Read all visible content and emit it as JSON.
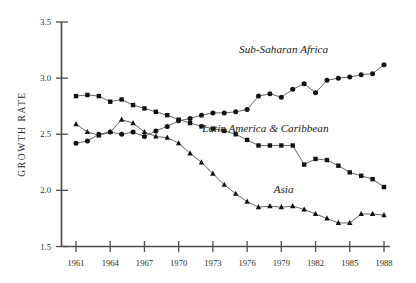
{
  "chart_data": {
    "type": "line",
    "title": "",
    "xlabel": "",
    "ylabel": "GROWTH RATE",
    "xlim": [
      1960,
      1989
    ],
    "ylim": [
      1.5,
      3.5
    ],
    "grid": false,
    "legend_position": "inline-annotations",
    "ytick_labels": [
      "1.5",
      "2.0",
      "2.5",
      "3.0",
      "3.5"
    ],
    "ytick_values": [
      1.5,
      2.0,
      2.5,
      3.0,
      3.5
    ],
    "xtick_labels": [
      "1961",
      "1964",
      "1967",
      "1970",
      "1973",
      "1976",
      "1979",
      "1982",
      "1985",
      "1988"
    ],
    "xtick_values": [
      1961,
      1964,
      1967,
      1970,
      1973,
      1976,
      1979,
      1982,
      1985,
      1988
    ],
    "x": [
      1961,
      1962,
      1963,
      1964,
      1965,
      1966,
      1967,
      1968,
      1969,
      1970,
      1971,
      1972,
      1973,
      1974,
      1975,
      1976,
      1977,
      1978,
      1979,
      1980,
      1981,
      1982,
      1983,
      1984,
      1985,
      1986,
      1987,
      1988
    ],
    "series": [
      {
        "name": "Sub-Saharan Africa",
        "marker": "circle",
        "values": [
          2.42,
          2.44,
          2.5,
          2.52,
          2.5,
          2.52,
          2.48,
          2.53,
          2.57,
          2.62,
          2.64,
          2.67,
          2.69,
          2.69,
          2.7,
          2.72,
          2.84,
          2.86,
          2.83,
          2.9,
          2.95,
          2.87,
          2.98,
          3.0,
          3.01,
          3.03,
          3.04,
          3.12
        ]
      },
      {
        "name": "Latin America & Caribbean",
        "marker": "square",
        "values": [
          2.84,
          2.85,
          2.84,
          2.79,
          2.81,
          2.76,
          2.73,
          2.7,
          2.67,
          2.63,
          2.6,
          2.57,
          2.55,
          2.53,
          2.5,
          2.45,
          2.4,
          2.4,
          2.4,
          2.4,
          2.23,
          2.28,
          2.27,
          2.22,
          2.16,
          2.13,
          2.1,
          2.03
        ]
      },
      {
        "name": "Asia",
        "marker": "triangle",
        "values": [
          2.59,
          2.52,
          2.49,
          2.52,
          2.63,
          2.6,
          2.52,
          2.48,
          2.47,
          2.42,
          2.33,
          2.25,
          2.15,
          2.05,
          1.97,
          1.9,
          1.85,
          1.86,
          1.85,
          1.86,
          1.83,
          1.79,
          1.75,
          1.71,
          1.71,
          1.79,
          1.79,
          1.78
        ]
      }
    ],
    "annotations": [
      {
        "text": "Sub-Saharan Africa",
        "x": 1979.2,
        "y": 3.22
      },
      {
        "text": "Latin America & Caribbean",
        "x": 1977.6,
        "y": 2.52
      },
      {
        "text": "Asia",
        "x": 1979.2,
        "y": 1.98
      }
    ],
    "colors": {
      "series_line": "#555555",
      "marker": "#111111",
      "axis": "#4d4d4d",
      "text": "#2b2b2b",
      "background": "#ffffff"
    }
  }
}
